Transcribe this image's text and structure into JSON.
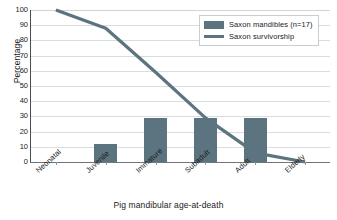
{
  "chart_data": {
    "type": "bar",
    "title": "",
    "xlabel": "Pig mandibular age-at-death",
    "ylabel": "Percentage",
    "categories": [
      "Neonatal",
      "Juvenile",
      "Immature",
      "Subadult",
      "Adult",
      "Elderly"
    ],
    "ylim": [
      0,
      100
    ],
    "ytick_labels": [
      "0",
      "10",
      "20",
      "30",
      "40",
      "50",
      "60",
      "70",
      "80",
      "90",
      "100"
    ],
    "ytick_values": [
      0,
      10,
      20,
      30,
      40,
      50,
      60,
      70,
      80,
      90,
      100
    ],
    "grid": true,
    "legend_position": "top-right",
    "series": [
      {
        "name": "Saxon mandibles (n=17)",
        "type": "bar",
        "color": "#5c747f",
        "values": [
          0,
          12,
          29,
          29,
          29,
          0
        ]
      },
      {
        "name": "Saxon survivorship",
        "type": "line",
        "color": "#5c747f",
        "values": [
          100,
          88,
          59,
          29,
          6,
          0
        ]
      }
    ]
  },
  "legend": {
    "items": [
      {
        "label": "Saxon mandibles (n=17)",
        "marker": "bar-swatch"
      },
      {
        "label": "Saxon survivorship",
        "marker": "line-swatch"
      }
    ]
  },
  "caption": {
    "fragment": ""
  },
  "colors": {
    "series": "#5c747f",
    "grid": "#d8dde0",
    "axis": "#4c4c4c",
    "background": "#ffffff"
  }
}
